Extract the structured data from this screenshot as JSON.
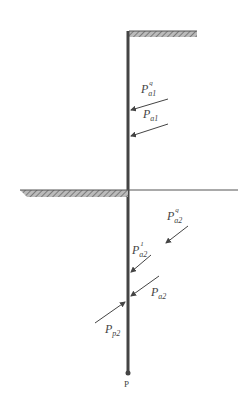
{
  "diagram": {
    "type": "retaining-wall-earth-pressure",
    "labels": {
      "pa1q": {
        "main": "P",
        "sub": "a1",
        "sup": "q"
      },
      "pa1": {
        "main": "P",
        "sub": "a1"
      },
      "pa2q": {
        "main": "P",
        "sub": "a2",
        "sup": "q"
      },
      "pa21": {
        "main": "P",
        "sub": "a2",
        "sup": "1"
      },
      "pa2": {
        "main": "P",
        "sub": "a2"
      },
      "pp2": {
        "main": "P",
        "sub": "p2"
      },
      "point": "P"
    },
    "colors": {
      "line": "#444444",
      "hatch": "#888888"
    }
  }
}
